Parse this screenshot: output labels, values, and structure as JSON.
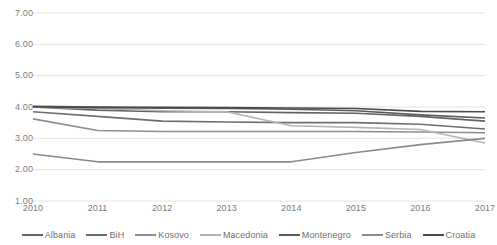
{
  "chart_data": {
    "type": "line",
    "title": "",
    "subtitle": "",
    "xlabel": "",
    "ylabel": "",
    "categories": [
      "2010",
      "2011",
      "2012",
      "2013",
      "2014",
      "2015",
      "2016",
      "2017"
    ],
    "x": [
      2010,
      2011,
      2012,
      2013,
      2014,
      2015,
      2016,
      2017
    ],
    "ylim": [
      1.0,
      7.0
    ],
    "ytick_labels": [
      "1.00",
      "2.00",
      "3.00",
      "4.00",
      "5.00",
      "6.00",
      "7.00"
    ],
    "ytick_values": [
      1.0,
      2.0,
      3.0,
      4.0,
      5.0,
      6.0,
      7.0
    ],
    "grid": "horizontal",
    "legend_position": "bottom",
    "series": [
      {
        "name": "Albania",
        "color": "#636363",
        "values": [
          4.0,
          3.9,
          3.85,
          3.85,
          3.82,
          3.8,
          3.7,
          3.55
        ]
      },
      {
        "name": "BiH",
        "color": "#6e6e6e",
        "values": [
          3.85,
          3.7,
          3.55,
          3.52,
          3.5,
          3.5,
          3.45,
          3.3
        ]
      },
      {
        "name": "Kosovo",
        "color": "#8e8e8e",
        "values": [
          3.62,
          3.25,
          3.22,
          3.22,
          3.22,
          3.22,
          3.2,
          3.18
        ]
      },
      {
        "name": "Macedonia",
        "color": "#b4b4b4",
        "values": [
          4.0,
          3.95,
          3.88,
          3.85,
          3.4,
          3.35,
          3.28,
          2.85
        ]
      },
      {
        "name": "Montenegro",
        "color": "#5b5b5b",
        "values": [
          4.0,
          3.98,
          3.96,
          3.95,
          3.93,
          3.88,
          3.75,
          3.65
        ]
      },
      {
        "name": "Serbia",
        "color": "#8a8a8a",
        "values": [
          2.5,
          2.25,
          2.25,
          2.25,
          2.25,
          2.55,
          2.8,
          3.0
        ]
      },
      {
        "name": "Croatia",
        "color": "#4a4a4a",
        "values": [
          4.02,
          4.0,
          3.99,
          3.98,
          3.97,
          3.95,
          3.86,
          3.85
        ]
      }
    ]
  },
  "axis": {
    "grid_color": "#e4e4e4",
    "tick_label_color": "#7d7d7d"
  }
}
